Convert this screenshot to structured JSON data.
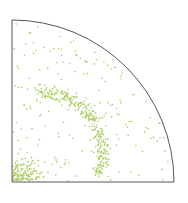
{
  "chart_data": {
    "type": "scatter",
    "title": "",
    "xlabel": "",
    "ylabel": "",
    "shape": "quarter-circle",
    "frame": {
      "origin_x": 12,
      "origin_y": 182,
      "radius": 162
    },
    "colors": {
      "frame": "#555555",
      "points": "#a9c95a",
      "background": "#ffffff"
    },
    "grid": false,
    "legend": null,
    "point_count": 620,
    "density_clusters": [
      {
        "name": "upper band",
        "description": "diagonal band from left edge (~y 80) curving down to bottom (~x 115)",
        "weight": 0.45
      },
      {
        "name": "lower-left cluster",
        "description": "dense region near bottom-left corner",
        "weight": 0.2
      },
      {
        "name": "background",
        "description": "sparse uniform scatter across quarter disc",
        "weight": 0.35
      }
    ]
  }
}
